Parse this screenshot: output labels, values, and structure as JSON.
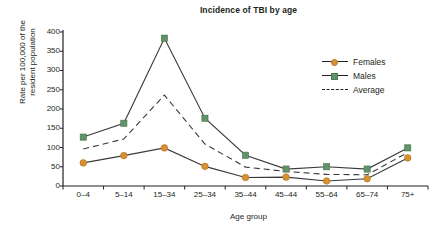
{
  "chart_data": {
    "type": "line",
    "title": "Incidence of TBI by age",
    "xlabel": "Age group",
    "ylabel_line1": "Rate per 100,000 of the",
    "ylabel_line2": "resident population",
    "ylabel": "Rate per 100,000 of the resident population",
    "categories": [
      "0–4",
      "5–14",
      "15–34",
      "25–34",
      "35–44",
      "45–44",
      "55–64",
      "65–74",
      "75+"
    ],
    "yticks": [
      0,
      50,
      100,
      150,
      200,
      250,
      300,
      350,
      400
    ],
    "ylim": [
      0,
      400
    ],
    "grid": false,
    "legend_position": "top-right",
    "series": [
      {
        "name": "Females",
        "color": "#d9912f",
        "marker": "circle",
        "linestyle": "solid",
        "values": [
          60,
          79,
          99,
          51,
          22,
          23,
          13,
          19,
          73
        ]
      },
      {
        "name": "Males",
        "color": "#5f9368",
        "marker": "square",
        "linestyle": "solid",
        "values": [
          127,
          163,
          384,
          176,
          80,
          44,
          50,
          44,
          99
        ]
      },
      {
        "name": "Average",
        "color": "#231f20",
        "marker": "none",
        "linestyle": "dashed",
        "values": [
          96,
          122,
          236,
          109,
          49,
          38,
          30,
          29,
          87
        ]
      }
    ]
  },
  "legend": {
    "items": [
      {
        "label": "Females",
        "marker": "circle-marker",
        "color": "#d9912f"
      },
      {
        "label": "Males",
        "marker": "square-marker",
        "color": "#5f9368"
      },
      {
        "label": "Average",
        "marker": "dashed-line-marker",
        "color": "#231f20"
      }
    ]
  },
  "axes": {
    "axis_color": "#231f20",
    "line_color": "#3a3a3a"
  }
}
